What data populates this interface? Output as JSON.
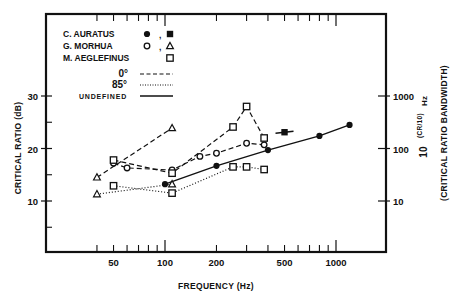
{
  "chart_data": {
    "type": "line",
    "title": "",
    "xlabel": "FREQUENCY (Hz)",
    "ylabel": "CRITICAL RATIO (dB)",
    "y2label": "10^(CR/10) Hz",
    "y2label_sub": "(CRITICAL RATIO BANDWIDTH)",
    "xscale": "log",
    "xlim": [
      30,
      1600
    ],
    "ylim": [
      5,
      35
    ],
    "x_ticks": [
      50,
      100,
      200,
      500,
      1000
    ],
    "x_tick_labels": [
      "50",
      "100",
      "200",
      "500",
      "1000"
    ],
    "y_ticks": [
      10,
      20,
      30
    ],
    "y_tick_labels": [
      "10",
      "20",
      "30"
    ],
    "y2_ticks": [
      10,
      20,
      30
    ],
    "y2_tick_labels": [
      "10",
      "100",
      "1000"
    ],
    "grid": false,
    "legend_position": "upper left",
    "legend": {
      "species": [
        {
          "name": "C. AURATUS",
          "markers": [
            "filled-circle",
            "filled-square"
          ]
        },
        {
          "name": "G. MORHUA",
          "markers": [
            "open-circle",
            "open-triangle"
          ]
        },
        {
          "name": "M. AEGLEFINUS",
          "markers": [
            "open-square"
          ]
        }
      ],
      "line_styles": [
        {
          "label": "0°",
          "style": "dashed"
        },
        {
          "label": "85°",
          "style": "dotted"
        },
        {
          "label": "UNDEFINED",
          "style": "solid"
        }
      ]
    },
    "series": [
      {
        "name": "C. AURATUS (undefined)",
        "marker": "filled-circle",
        "line": "solid",
        "x": [
          100,
          200,
          400,
          800,
          1200
        ],
        "y": [
          13.2,
          16.7,
          19.7,
          22.4,
          24.5
        ]
      },
      {
        "name": "C. AURATUS (undefined, square)",
        "marker": "filled-square",
        "line": "solid",
        "x": [
          500
        ],
        "y": [
          23.1
        ]
      },
      {
        "name": "G. MORHUA circles 0°",
        "marker": "open-circle",
        "line": "dashed",
        "x": [
          50,
          60,
          110,
          160,
          200,
          300,
          380
        ],
        "y": [
          17.2,
          16.3,
          15.9,
          18.5,
          19.1,
          21.0,
          20.7
        ]
      },
      {
        "name": "G. MORHUA triangles 0°",
        "marker": "open-triangle",
        "line": "dashed",
        "x": [
          40,
          110
        ],
        "y": [
          14.5,
          23.9
        ]
      },
      {
        "name": "G. MORHUA triangles 85°",
        "marker": "open-triangle",
        "line": "dotted",
        "x": [
          40,
          110
        ],
        "y": [
          11.3,
          13.2
        ]
      },
      {
        "name": "M. AEGLEFINUS 0°",
        "marker": "open-square",
        "line": "dashed",
        "x": [
          50,
          110,
          250,
          300,
          380
        ],
        "y": [
          17.8,
          15.3,
          24.1,
          28.0,
          22.0
        ]
      },
      {
        "name": "M. AEGLEFINUS 85°",
        "marker": "open-square",
        "line": "dotted",
        "x": [
          50,
          110,
          250,
          300,
          380
        ],
        "y": [
          12.9,
          11.5,
          16.5,
          16.5,
          16.0
        ]
      }
    ]
  }
}
